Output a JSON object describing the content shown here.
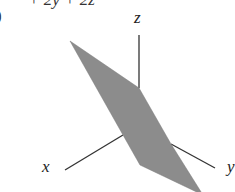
{
  "figure": {
    "part_label": ")",
    "equation_fragment": "+ 2y + 2z",
    "axes": {
      "x_label": "x",
      "y_label": "y",
      "z_label": "z"
    },
    "colors": {
      "plane_fill": "#8c8c8c",
      "axis_stroke": "#333333",
      "background": "#ffffff"
    }
  }
}
